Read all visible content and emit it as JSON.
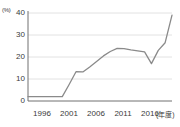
{
  "chart_data": {
    "type": "line",
    "title": "",
    "unit_label": "(%)",
    "xlabel": "(年度)",
    "ylabel": "",
    "ylim": [
      0,
      40
    ],
    "xlim": [
      1996,
      2017
    ],
    "grid": true,
    "legend": false,
    "line_color": "#8a8a8a",
    "y_ticks": [
      40,
      30,
      20,
      10,
      0
    ],
    "y_tick_labels": [
      "40",
      "30",
      "20",
      "10",
      "0"
    ],
    "x_ticks": [
      1996,
      2001,
      2006,
      2011,
      2016
    ],
    "x_tick_labels": [
      "1996",
      "2001",
      "2006",
      "2011",
      "2016"
    ],
    "x": [
      1996,
      1997,
      1998,
      1999,
      2000,
      2001,
      2002,
      2003,
      2004,
      2005,
      2006,
      2007,
      2008,
      2009,
      2010,
      2011,
      2012,
      2013,
      2014,
      2015,
      2016,
      2017
    ],
    "values": [
      2.0,
      2.0,
      2.0,
      2.0,
      2.0,
      2.0,
      7.5,
      13.3,
      13.2,
      15.5,
      18.0,
      20.5,
      22.5,
      23.9,
      23.8,
      23.2,
      22.8,
      22.3,
      17.0,
      23.0,
      26.5,
      39.0
    ],
    "series": [
      {
        "name": "割合",
        "values": [
          2.0,
          2.0,
          2.0,
          2.0,
          2.0,
          2.0,
          7.5,
          13.3,
          13.2,
          15.5,
          18.0,
          20.5,
          22.5,
          23.9,
          23.8,
          23.2,
          22.8,
          22.3,
          17.0,
          23.0,
          26.5,
          39.0
        ]
      }
    ],
    "annotations": []
  }
}
